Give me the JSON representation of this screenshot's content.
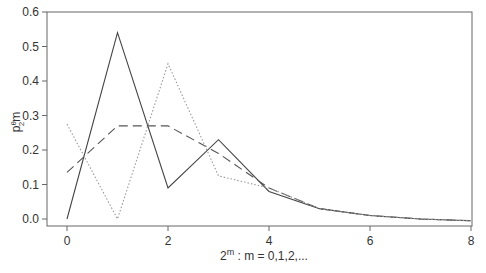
{
  "chart_data": {
    "type": "line",
    "title": "",
    "xlabel": "2^m : m = 0,1,2,...",
    "xlabel_parts": {
      "base": "2",
      "sup": "m",
      "rest": " : m = 0,1,2,..."
    },
    "ylabel": "p^θ_{2^m}",
    "ylabel_parts": {
      "p": "p",
      "sup": "θ",
      "sub": "2",
      "subsup": "m"
    },
    "xlim": [
      0,
      8
    ],
    "ylim": [
      0.0,
      0.6
    ],
    "x_ticks": [
      0,
      2,
      4,
      6,
      8
    ],
    "y_ticks": [
      "0.0",
      "0.1",
      "0.2",
      "0.3",
      "0.4",
      "0.5",
      "0.6"
    ],
    "grid": false,
    "legend": null,
    "x": [
      0,
      1,
      2,
      3,
      4,
      5,
      6,
      7,
      8
    ],
    "series": [
      {
        "name": "solid",
        "style": "solid",
        "color": "#444444",
        "values": [
          0.0,
          0.54,
          0.09,
          0.23,
          0.08,
          0.03,
          0.01,
          0.0,
          -0.005
        ]
      },
      {
        "name": "dashed",
        "style": "dashed",
        "color": "#555555",
        "values": [
          0.135,
          0.27,
          0.27,
          0.19,
          0.09,
          0.03,
          0.01,
          0.0,
          -0.005
        ]
      },
      {
        "name": "dotted",
        "style": "dotted",
        "color": "#999999",
        "values": [
          0.275,
          0.0,
          0.45,
          0.125,
          0.09,
          0.03,
          0.01,
          0.0,
          -0.005
        ]
      }
    ]
  }
}
